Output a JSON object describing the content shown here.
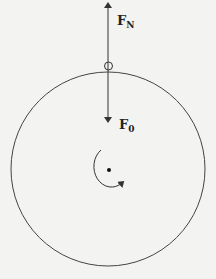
{
  "diagram": {
    "title": "",
    "colors": {
      "background": "#f3f3f1",
      "stroke": "#333333"
    },
    "wheel": {
      "cx": 108,
      "cy": 169,
      "r": 97
    },
    "contact_point": {
      "cx": 109,
      "cy": 66,
      "r": 4,
      "label": ""
    },
    "forces": [
      {
        "id": "normal",
        "label_main": "F",
        "label_sub": "N",
        "direction": "up",
        "from": [
          108,
          66
        ],
        "to": [
          108,
          3
        ]
      },
      {
        "id": "applied",
        "label_main": "F",
        "label_sub": "0",
        "direction": "down",
        "from": [
          108,
          66
        ],
        "to": [
          108,
          122
        ]
      }
    ],
    "rotation": {
      "direction": "counterclockwise",
      "center": [
        108,
        169
      ]
    }
  }
}
